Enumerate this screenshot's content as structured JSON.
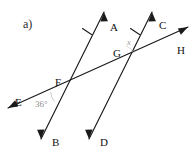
{
  "figure": {
    "part_label": "a)",
    "background_color": "#ffffff",
    "line_color": "#1a1a1a",
    "angle_text_color": "#8d8d8d",
    "width": 194,
    "height": 149
  },
  "points": [
    {
      "id": "A",
      "label": "A",
      "x": 110,
      "y": 22
    },
    {
      "id": "B",
      "label": "B",
      "x": 52,
      "y": 137
    },
    {
      "id": "C",
      "label": "C",
      "x": 159,
      "y": 20
    },
    {
      "id": "D",
      "label": "D",
      "x": 100,
      "y": 137
    },
    {
      "id": "E",
      "label": "E",
      "x": 15,
      "y": 97
    },
    {
      "id": "F",
      "label": "F",
      "x": 55,
      "y": 77
    },
    {
      "id": "G",
      "label": "G",
      "x": 113,
      "y": 48
    },
    {
      "id": "H",
      "label": "H",
      "x": 177,
      "y": 45
    }
  ],
  "lines": [
    {
      "id": "AB",
      "name": "line-ab",
      "from": "B",
      "to": "A",
      "parallel_ticks": 1,
      "arrow_start": true,
      "arrow_end": true
    },
    {
      "id": "CD",
      "name": "line-cd",
      "from": "D",
      "to": "C",
      "parallel_ticks": 1,
      "arrow_start": true,
      "arrow_end": true
    },
    {
      "id": "EH",
      "name": "line-eh-transversal",
      "from": "E",
      "to": "H",
      "parallel_ticks": 0,
      "arrow_start": true,
      "arrow_end": true
    }
  ],
  "intersections": [
    {
      "id": "F",
      "label": "F",
      "x": 62,
      "y": 87
    },
    {
      "id": "G",
      "label": "G",
      "x": 121,
      "y": 58
    }
  ],
  "angles": [
    {
      "id": "angle-f",
      "vertex": "F",
      "text": "36°",
      "value": 36,
      "unit": "degrees",
      "x": 35,
      "y": 100
    },
    {
      "id": "angle-g",
      "vertex": "G",
      "text": "x",
      "value": null,
      "unit": "unknown",
      "x": 127,
      "y": 38
    }
  ]
}
